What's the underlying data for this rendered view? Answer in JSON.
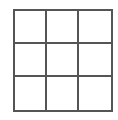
{
  "board": {
    "rows": 3,
    "cols": 3,
    "line_color": "#555555",
    "cells": [
      "",
      "",
      "",
      "",
      "",
      "",
      "",
      "",
      ""
    ]
  }
}
